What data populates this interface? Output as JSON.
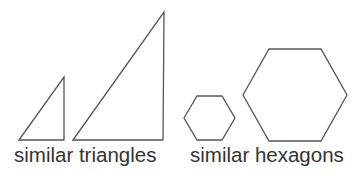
{
  "groups": [
    {
      "caption": "similar triangles",
      "shapes": [
        {
          "kind": "triangle",
          "size": "small",
          "points": "19,140 64,77 64,140"
        },
        {
          "kind": "triangle",
          "size": "large",
          "points": "73,140 164,12 163,140"
        }
      ]
    },
    {
      "caption": "similar hexagons",
      "shapes": [
        {
          "kind": "hexagon",
          "size": "small",
          "points": "184,118 197,96 222,96 235,118 222,140 197,140"
        },
        {
          "kind": "hexagon",
          "size": "large",
          "points": "243,95 269,49 321,49 347,95 321,141 269,141"
        }
      ]
    }
  ],
  "colors": {
    "stroke": "#555555",
    "text": "#333333",
    "background": "#ffffff"
  }
}
